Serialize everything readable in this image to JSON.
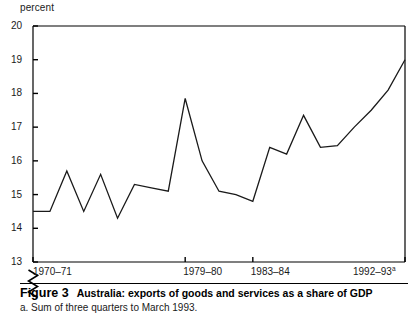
{
  "figure": {
    "unit_label": "percent",
    "number": "Figure 3",
    "title": "Australia: exports of goods and services as a share of GDP",
    "footnote": "a. Sum of three quarters to March 1993."
  },
  "chart_data": {
    "type": "line",
    "title": "Australia: exports of goods and services as a share of GDP",
    "xlabel": "",
    "ylabel": "percent",
    "ylim": [
      13,
      20
    ],
    "yticks": [
      13,
      14,
      15,
      16,
      17,
      18,
      19,
      20
    ],
    "ytick_labels": [
      "13",
      "14",
      "15",
      "16",
      "17",
      "18",
      "19",
      "20"
    ],
    "y_axis_break": true,
    "grid": false,
    "legend": "none",
    "xtick_labels": [
      "1970–71",
      "1979–80",
      "1983–84",
      "1992–93"
    ],
    "xtick_superscripts": [
      "",
      "",
      "",
      "a"
    ],
    "xtick_years": [
      "1970-71",
      "1979-80",
      "1983-84",
      "1992-93"
    ],
    "x": [
      "1970-71",
      "1971-72",
      "1972-73",
      "1973-74",
      "1974-75",
      "1975-76",
      "1976-77",
      "1977-78",
      "1978-79",
      "1979-80",
      "1980-81",
      "1981-82",
      "1982-83",
      "1983-84",
      "1984-85",
      "1985-86",
      "1986-87",
      "1987-88",
      "1988-89",
      "1989-90",
      "1990-91",
      "1991-92",
      "1992-93"
    ],
    "values": [
      14.5,
      14.5,
      15.7,
      14.5,
      15.6,
      14.3,
      15.3,
      15.2,
      15.1,
      17.85,
      16.0,
      15.1,
      15.0,
      14.8,
      16.4,
      16.2,
      17.35,
      16.4,
      16.45,
      17.0,
      17.5,
      18.1,
      19.0
    ],
    "series": [
      {
        "name": "exports of goods and services as a share of GDP",
        "color": "#1a1a1a",
        "values": [
          14.5,
          14.5,
          15.7,
          14.5,
          15.6,
          14.3,
          15.3,
          15.2,
          15.1,
          17.85,
          16.0,
          15.1,
          15.0,
          14.8,
          16.4,
          16.2,
          17.35,
          16.4,
          16.45,
          17.0,
          17.5,
          18.1,
          19.0
        ]
      }
    ],
    "annotations": [
      "a. Sum of three quarters to March 1993."
    ]
  },
  "colors": {
    "line": "#1a1a1a",
    "axis": "#000000",
    "background": "#ffffff"
  }
}
